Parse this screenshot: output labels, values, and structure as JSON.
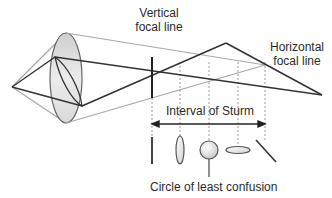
{
  "labels": {
    "vertical_focal_line": [
      "Vertical",
      "focal line"
    ],
    "horizontal_focal_line": [
      "Horizontal",
      "focal line"
    ],
    "interval": "Interval of Sturm",
    "circle": "Circle of least confusion"
  },
  "colors": {
    "dark_ray": "#333333",
    "light_ray": "#a8a8a8",
    "dashed": "#9a9a9a",
    "lens_fill_top": "#d0d0d0",
    "lens_fill_bottom": "#f4f4f4",
    "lens_stroke": "#666666"
  },
  "cross_sections": [
    {
      "shape": "vertical-line",
      "x": 152
    },
    {
      "shape": "vertical-ellipse",
      "x": 180
    },
    {
      "shape": "circle",
      "x": 209
    },
    {
      "shape": "horizontal-ellipse",
      "x": 238
    },
    {
      "shape": "diagonal-line",
      "x": 265
    }
  ]
}
